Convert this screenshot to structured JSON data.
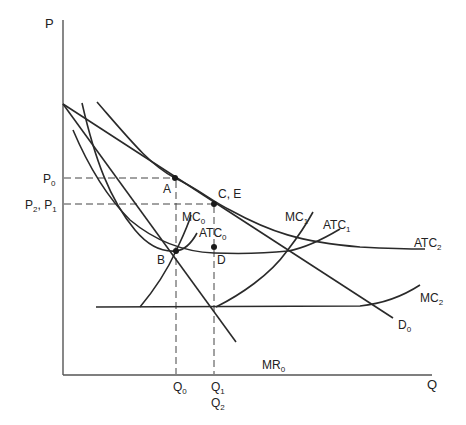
{
  "diagram": {
    "title": "",
    "axes": {
      "y_label": "P",
      "x_label": "Q"
    },
    "price_ticks": [
      {
        "label": "P",
        "sub": "0"
      },
      {
        "label": "P",
        "sub": "2",
        "label2": "P",
        "sub2": "1",
        "sep": ", "
      }
    ],
    "quantity_ticks": [
      {
        "label": "Q",
        "sub": "0"
      },
      {
        "label": "Q",
        "sub": "1"
      },
      {
        "label": "Q",
        "sub": "2"
      }
    ],
    "curves": [
      {
        "id": "D0",
        "label": "D",
        "sub": "0"
      },
      {
        "id": "MR0",
        "label": "MR",
        "sub": "0"
      },
      {
        "id": "MC0",
        "label": "MC",
        "sub": "0"
      },
      {
        "id": "ATC0",
        "label": "ATC",
        "sub": "0"
      },
      {
        "id": "MC1",
        "label": "MC",
        "sub": "1"
      },
      {
        "id": "ATC1",
        "label": "ATC",
        "sub": "1"
      },
      {
        "id": "MC2",
        "label": "MC",
        "sub": "2"
      },
      {
        "id": "ATC2",
        "label": "ATC",
        "sub": "2"
      }
    ],
    "points": [
      {
        "id": "A",
        "label": "A"
      },
      {
        "id": "B",
        "label": "B"
      },
      {
        "id": "CE",
        "label": "C, E"
      },
      {
        "id": "D",
        "label": "D"
      }
    ],
    "colors": {
      "ink": "#2a2a2a",
      "background": "#ffffff"
    }
  }
}
